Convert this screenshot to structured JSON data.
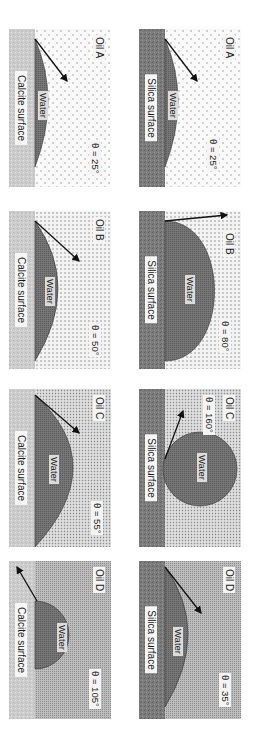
{
  "figure": {
    "colors": {
      "background": "#ffffff",
      "water": "#6e6e6e",
      "silica_surface": "#7a7a7a",
      "calcite_surface": "#c8c8c8",
      "arrow": "#111111"
    },
    "rows": [
      {
        "surface": "Silica surface",
        "panels": [
          {
            "oil": "Oil A",
            "theta": "θ = 25°",
            "angle_deg": 25,
            "water": "Water",
            "oil_pattern": "sparse-dots"
          },
          {
            "oil": "Oil B",
            "theta": "θ = 80°",
            "angle_deg": 80,
            "water": "Water",
            "oil_pattern": "grid-dots"
          },
          {
            "oil": "Oil C",
            "theta": "θ = 160°",
            "angle_deg": 160,
            "water": "Water",
            "oil_pattern": "dense-dots"
          },
          {
            "oil": "Oil D",
            "theta": "θ = 35°",
            "angle_deg": 35,
            "water": "Water",
            "oil_pattern": "hatched"
          }
        ]
      },
      {
        "surface": "Calcite surface",
        "panels": [
          {
            "oil": "Oil A",
            "theta": "θ = 25°",
            "angle_deg": 25,
            "water": "Water",
            "oil_pattern": "sparse-dots"
          },
          {
            "oil": "Oil B",
            "theta": "θ = 50°",
            "angle_deg": 50,
            "water": "Water",
            "oil_pattern": "grid-dots"
          },
          {
            "oil": "Oil C",
            "theta": "θ = 55°",
            "angle_deg": 55,
            "water": "Water",
            "oil_pattern": "dense-dots"
          },
          {
            "oil": "Oil D",
            "theta": "θ = 105°",
            "angle_deg": 105,
            "water": "Water",
            "oil_pattern": "hatched"
          }
        ]
      }
    ]
  }
}
